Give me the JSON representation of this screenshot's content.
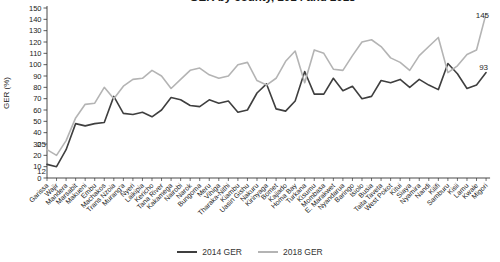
{
  "title_partial": "GER by county, 2014 and 2018",
  "chart_data": {
    "type": "line",
    "ylabel": "GER (%)",
    "ylim": [
      0,
      150
    ],
    "yticks": [
      0,
      10,
      20,
      30,
      40,
      50,
      60,
      70,
      80,
      90,
      100,
      110,
      120,
      130,
      140,
      150
    ],
    "grid": false,
    "legend_position": "bottom-center",
    "categories": [
      "Garissa",
      "Wajir",
      "Mandera",
      "Marsabit",
      "Makueni",
      "Embu",
      "Machakos",
      "Trans Nzoia",
      "Murang'a",
      "Nyeri",
      "Laikipia",
      "Kericho",
      "Tana River",
      "Kakamega",
      "Nairobi",
      "Narok",
      "Bungoma",
      "Meru",
      "Vihiga",
      "Tharaka-Nithi",
      "Kiambu",
      "Uasin Gishu",
      "Nakuru",
      "Kirinyaga",
      "Bomet",
      "Kajiado",
      "Homa Bay",
      "Turkana",
      "Kisumu",
      "Mombasa",
      "E. Marakwet",
      "Nyandarua",
      "Baringo",
      "Isiolo",
      "Busia",
      "Taita Taveta",
      "West Pokot",
      "Kitui",
      "Siaya",
      "Nyamira",
      "Nandi",
      "Kilifi",
      "Samburu",
      "Kisii",
      "Lamu",
      "Kwale",
      "Migori"
    ],
    "series": [
      {
        "name": "2014 GER",
        "color": "#3f3f3f",
        "values": [
          12,
          10,
          25,
          48,
          46,
          48,
          49,
          72,
          57,
          56,
          58,
          54,
          60,
          71,
          69,
          64,
          63,
          69,
          66,
          68,
          58,
          60,
          75,
          83,
          61,
          59,
          68,
          94,
          74,
          74,
          88,
          77,
          81,
          70,
          72,
          86,
          84,
          87,
          80,
          87,
          82,
          78,
          101,
          92,
          79,
          82,
          93
        ]
      },
      {
        "name": "2018 GER",
        "color": "#b4b4b4",
        "values": [
          25,
          20,
          33,
          53,
          65,
          66,
          80,
          70,
          81,
          87,
          88,
          95,
          90,
          79,
          87,
          95,
          97,
          91,
          88,
          90,
          100,
          102,
          86,
          82,
          88,
          103,
          112,
          84,
          113,
          110,
          96,
          95,
          108,
          120,
          122,
          116,
          106,
          102,
          95,
          108,
          116,
          124,
          93,
          99,
          109,
          113,
          145
        ]
      }
    ],
    "annotations": [
      {
        "text": "25",
        "series": "2018 GER",
        "category": "Garissa",
        "value": 25,
        "dx": -1,
        "dy": -3,
        "anchor": "end"
      },
      {
        "text": "12",
        "series": "2014 GER",
        "category": "Garissa",
        "value": 12,
        "dx": -1,
        "dy": 10,
        "anchor": "end"
      },
      {
        "text": "145",
        "series": "2018 GER",
        "category": "Migori",
        "value": 145,
        "dx": 3,
        "dy": 4,
        "anchor": "end"
      },
      {
        "text": "93",
        "series": "2014 GER",
        "category": "Migori",
        "value": 93,
        "dx": 2,
        "dy": -3,
        "anchor": "end"
      }
    ]
  },
  "legend": {
    "items": [
      {
        "label": "2014 GER",
        "color": "#3f3f3f"
      },
      {
        "label": "2018 GER",
        "color": "#b4b4b4"
      }
    ]
  }
}
